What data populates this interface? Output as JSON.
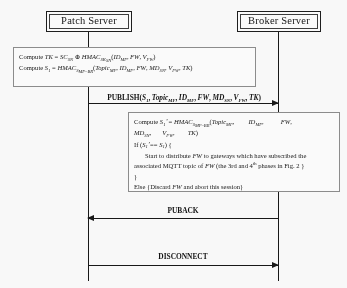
{
  "diagram": {
    "type": "sequence-diagram",
    "actors": [
      {
        "id": "patch-server",
        "label": "Patch Server"
      },
      {
        "id": "broker-server",
        "label": "Broker Server"
      }
    ],
    "notes": [
      {
        "id": "patch-compute-note",
        "owner": "patch-server",
        "lines": [
          "Compute TK = SC_SN ⊕ HMAC_SK_SN(ID_MF, FW, V_FW)",
          "Compute S_1 = HMAC_S_MF-BR(Topic_MF, ID_MF, FW, MD_SN, V_FW, TK)"
        ]
      },
      {
        "id": "broker-verify-note",
        "owner": "broker-server",
        "lines": [
          "Compute S_1' = HMAC_S_MF-BR(Topic_MF,      ID_MF,      FW,",
          "MD_SN,     V_FW,     TK)",
          "If (S_1' == S_1) {",
          "Start to distribute FW to gateways which have subscribed the associated MQTT topic of FW (the 3rd and 4th phases in Fig. 2 )",
          "}",
          "Else {Discard FW and abort this session}"
        ]
      }
    ],
    "messages": [
      {
        "id": "publish-message",
        "label": "PUBLISH(S_1, Topic_MF, ID_MF, FW, MD_SN, V_FW, TK)",
        "from": "patch-server",
        "to": "broker-server",
        "direction": "right"
      },
      {
        "id": "puback-message",
        "label": "PUBACK",
        "from": "broker-server",
        "to": "patch-server",
        "direction": "left"
      },
      {
        "id": "disconnect-message",
        "label": "DISCONNECT",
        "from": "patch-server",
        "to": "broker-server",
        "direction": "right"
      }
    ],
    "symbols": {
      "xor": "⊕",
      "equals": "=",
      "double_equals": "==",
      "prime": "'"
    },
    "colors": {
      "line": "#141414",
      "note_border": "#8d8d8d",
      "background": "#ffffff",
      "text": "#141414"
    }
  }
}
